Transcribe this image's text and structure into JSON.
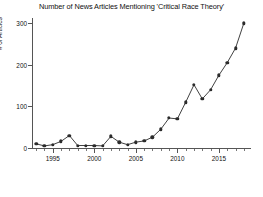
{
  "chart_data": {
    "type": "line",
    "title": "Number of News Articles Mentioning 'Critical Race Theory'",
    "xlabel": "",
    "ylabel": "# of Articles",
    "x": [
      1993,
      1994,
      1995,
      1996,
      1997,
      1998,
      1999,
      2000,
      2001,
      2002,
      2003,
      2004,
      2005,
      2006,
      2007,
      2008,
      2009,
      2010,
      2011,
      2012,
      2013,
      2014,
      2015,
      2016,
      2017,
      2018
    ],
    "values": [
      10,
      5,
      8,
      16,
      30,
      6,
      6,
      6,
      5,
      28,
      14,
      8,
      14,
      17,
      26,
      45,
      72,
      70,
      110,
      152,
      118,
      140,
      175,
      205,
      240,
      300
    ],
    "series": [
      {
        "name": "# of Articles",
        "values": [
          10,
          5,
          8,
          16,
          30,
          6,
          6,
          6,
          5,
          28,
          14,
          8,
          14,
          17,
          26,
          45,
          72,
          70,
          110,
          152,
          118,
          140,
          175,
          205,
          240,
          300
        ]
      }
    ],
    "xlim": [
      1992.5,
      2018.5
    ],
    "ylim": [
      0,
      310
    ],
    "x_ticks": [
      1995,
      2000,
      2005,
      2010,
      2015
    ],
    "x_tick_labels": [
      "1995",
      "2000",
      "2005",
      "2010",
      "2015"
    ],
    "y_ticks": [
      0,
      100,
      200,
      300
    ],
    "y_tick_labels": [
      "0",
      "100",
      "200",
      "300"
    ],
    "grid": false,
    "legend": "none",
    "marker": "filled-circle",
    "line_color": "#2b2b2b",
    "marker_color": "#2b2b2b",
    "background_color": "#ffffff"
  }
}
